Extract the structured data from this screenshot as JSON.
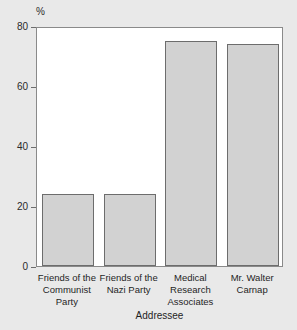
{
  "chart_data": {
    "type": "bar",
    "title": "",
    "subtitle": "",
    "xlabel": "Addressee",
    "ylabel": "%",
    "yunit": "%",
    "categories": [
      "Friends of the Communist Party",
      "Friends of the Nazi Party",
      "Medical Research Associates",
      "Mr. Walter Carnap"
    ],
    "category_lines": [
      [
        "Friends of the",
        "Communist",
        "Party"
      ],
      [
        "Friends of the",
        "Nazi Party"
      ],
      [
        "Medical",
        "Research",
        "Associates"
      ],
      [
        "Mr. Walter",
        "Carnap"
      ]
    ],
    "values": [
      24,
      24,
      75,
      74
    ],
    "ylim": [
      0,
      80
    ],
    "yticks": [
      0,
      20,
      40,
      60,
      80
    ],
    "ytick_labels": [
      "0",
      "20",
      "40",
      "60",
      "80"
    ],
    "grid": false,
    "legend": false,
    "legend_position": "none",
    "bar_color": "#d2d2d2",
    "bar_border_color": "#6d6d6d",
    "plot_background": "#ffffff",
    "figure_background": "#e9e9e9",
    "axis_color": "#6d6d6d",
    "text_color": "#1f1f1f"
  }
}
